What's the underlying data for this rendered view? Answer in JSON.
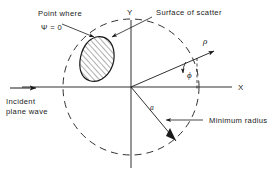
{
  "figure": {
    "title_region": "scattering geometry diagram",
    "background_color": "#ffffff",
    "line_color": "#1a1a1a",
    "labels": {
      "point_where": "Point where",
      "psi_zero": "Ψ = 0",
      "surface_of_scatter": "Surface of scatter",
      "incident_line1": "Incident",
      "incident_line2": "plane wave",
      "minimum_radius": "Minimum radius",
      "axis_x": "X",
      "axis_y": "Y",
      "rho": "ρ",
      "phi": "ϕ",
      "radius_a": "a"
    },
    "elements": {
      "dashed_circle": "minimum-radius-circle",
      "scatterer": "hatched-scatterer-blob",
      "incident_arrow": "rightward-arrow",
      "rho_ray": "radial-vector-rho",
      "phi_arc": "angle-arc-phi",
      "radius_line": "minimum-radius-line-a"
    }
  }
}
